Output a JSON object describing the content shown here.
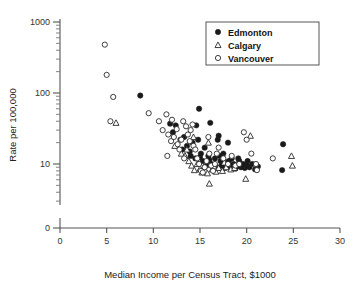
{
  "chart_data": {
    "type": "scatter",
    "title": "",
    "xlabel": "Median Income per Census Tract, $1000",
    "ylabel": "Rate per 100,000",
    "xlim": [
      0,
      30
    ],
    "xticks": [
      0,
      5,
      10,
      15,
      20,
      25,
      30
    ],
    "xtick_labels": [
      "0",
      "5",
      "10",
      "15",
      "20",
      "25",
      "30"
    ],
    "yscale": "log",
    "ylim": [
      3,
      1000
    ],
    "yticks": [
      10,
      100,
      1000
    ],
    "ytick_labels": [
      "10",
      "100",
      "1000"
    ],
    "y_origin_label": "0",
    "grid": false,
    "legend_position": "top-right",
    "series": [
      {
        "name": "Edmonton",
        "marker": "filled-circle",
        "color": "#1a1a1a",
        "points": [
          [
            8.6,
            92
          ],
          [
            11.8,
            37
          ],
          [
            12.4,
            35
          ],
          [
            12.9,
            22
          ],
          [
            13.3,
            24
          ],
          [
            13.6,
            18
          ],
          [
            13.9,
            15
          ],
          [
            14.2,
            20
          ],
          [
            14.5,
            12
          ],
          [
            14.6,
            35
          ],
          [
            14.9,
            60
          ],
          [
            15.1,
            14
          ],
          [
            15.3,
            11
          ],
          [
            15.5,
            17
          ],
          [
            15.7,
            9.5
          ],
          [
            15.9,
            13
          ],
          [
            16.1,
            38
          ],
          [
            16.2,
            10
          ],
          [
            16.4,
            8.5
          ],
          [
            16.6,
            12
          ],
          [
            16.8,
            9
          ],
          [
            17.0,
            25
          ],
          [
            17.2,
            11
          ],
          [
            17.3,
            9.5
          ],
          [
            17.5,
            14
          ],
          [
            17.7,
            8.8
          ],
          [
            17.9,
            10.5
          ],
          [
            18.0,
            20
          ],
          [
            18.2,
            9
          ],
          [
            18.4,
            12
          ],
          [
            18.6,
            10
          ],
          [
            18.8,
            8.6
          ],
          [
            19.0,
            9.4
          ],
          [
            19.2,
            11
          ],
          [
            19.4,
            9
          ],
          [
            19.6,
            10
          ],
          [
            19.8,
            8.8
          ],
          [
            20.0,
            9.6
          ],
          [
            20.3,
            9
          ],
          [
            20.6,
            10
          ],
          [
            20.9,
            8.4
          ],
          [
            21.2,
            9.2
          ],
          [
            12.1,
            28
          ],
          [
            13.1,
            16
          ],
          [
            14.0,
            13
          ],
          [
            15.0,
            12.5
          ],
          [
            16.0,
            11.5
          ],
          [
            17.1,
            13
          ],
          [
            18.1,
            11
          ],
          [
            19.1,
            12
          ],
          [
            20.1,
            11
          ],
          [
            14.8,
            22
          ],
          [
            16.9,
            22
          ],
          [
            23.9,
            19
          ],
          [
            23.8,
            8.2
          ]
        ]
      },
      {
        "name": "Calgary",
        "marker": "open-triangle",
        "color": "#2a2a2a",
        "points": [
          [
            6.0,
            38
          ],
          [
            12.3,
            18
          ],
          [
            13.0,
            14
          ],
          [
            13.4,
            13
          ],
          [
            13.8,
            11
          ],
          [
            14.1,
            9.5
          ],
          [
            14.4,
            8.2
          ],
          [
            14.7,
            10
          ],
          [
            15.0,
            8.6
          ],
          [
            15.2,
            7.6
          ],
          [
            15.4,
            9
          ],
          [
            15.6,
            8
          ],
          [
            15.8,
            7.4
          ],
          [
            16.0,
            5.3
          ],
          [
            16.3,
            8.4
          ],
          [
            16.5,
            9.2
          ],
          [
            16.7,
            7.8
          ],
          [
            17.0,
            8.8
          ],
          [
            17.4,
            8
          ],
          [
            17.8,
            9
          ],
          [
            18.3,
            8.4
          ],
          [
            18.7,
            8.8
          ],
          [
            19.9,
            6.2
          ],
          [
            20.4,
            25
          ],
          [
            24.8,
            13
          ],
          [
            24.9,
            9.5
          ],
          [
            14.3,
            24
          ],
          [
            15.9,
            20
          ],
          [
            13.6,
            16
          ],
          [
            17.6,
            10.5
          ]
        ]
      },
      {
        "name": "Vancouver",
        "marker": "open-circle",
        "color": "#2a2a2a",
        "points": [
          [
            4.8,
            480
          ],
          [
            5.0,
            180
          ],
          [
            5.7,
            88
          ],
          [
            5.4,
            40
          ],
          [
            9.5,
            52
          ],
          [
            10.6,
            40
          ],
          [
            11.4,
            50
          ],
          [
            11.0,
            30
          ],
          [
            11.6,
            26
          ],
          [
            11.9,
            21
          ],
          [
            11.5,
            13
          ],
          [
            12.0,
            42
          ],
          [
            12.2,
            24
          ],
          [
            12.6,
            19
          ],
          [
            12.8,
            16
          ],
          [
            13.0,
            22
          ],
          [
            13.2,
            40
          ],
          [
            13.5,
            34
          ],
          [
            13.7,
            26
          ],
          [
            14.0,
            30
          ],
          [
            14.3,
            18
          ],
          [
            14.5,
            16
          ],
          [
            14.7,
            12
          ],
          [
            14.9,
            10
          ],
          [
            15.1,
            8
          ],
          [
            15.3,
            7.6
          ],
          [
            15.5,
            9
          ],
          [
            15.7,
            11
          ],
          [
            16.0,
            14
          ],
          [
            16.2,
            9.5
          ],
          [
            16.4,
            8
          ],
          [
            16.6,
            10
          ],
          [
            17.0,
            17
          ],
          [
            17.5,
            12
          ],
          [
            18.0,
            10
          ],
          [
            18.4,
            13
          ],
          [
            18.8,
            9.5
          ],
          [
            19.2,
            10
          ],
          [
            19.7,
            28
          ],
          [
            20.0,
            22
          ],
          [
            20.5,
            14
          ],
          [
            21.0,
            10
          ],
          [
            21.1,
            8.2
          ],
          [
            22.8,
            12
          ],
          [
            13.9,
            21
          ],
          [
            12.5,
            31
          ],
          [
            14.2,
            36
          ],
          [
            15.9,
            24
          ],
          [
            16.8,
            14
          ],
          [
            13.3,
            12
          ]
        ]
      }
    ]
  },
  "legend": {
    "entries": [
      {
        "label": "Edmonton",
        "marker": "filled-circle"
      },
      {
        "label": "Calgary",
        "marker": "open-triangle"
      },
      {
        "label": "Vancouver",
        "marker": "open-circle"
      }
    ]
  }
}
